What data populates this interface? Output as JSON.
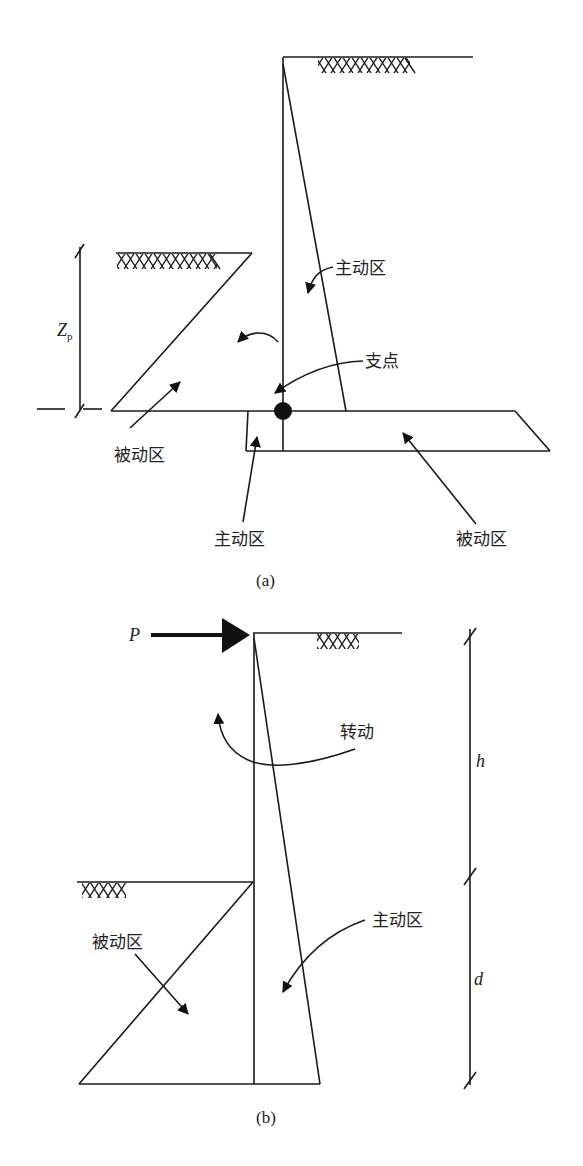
{
  "figure_a": {
    "caption": "(a)",
    "labels": {
      "active_upper": "主动区",
      "pivot": "支点",
      "passive_left": "被动区",
      "active_lower": "主动区",
      "passive_right": "被动区",
      "dimension": "Z",
      "dimension_sub": "p"
    }
  },
  "figure_b": {
    "caption": "(b)",
    "labels": {
      "force": "P",
      "rotation": "转动",
      "active": "主动区",
      "passive": "被动区",
      "height_h": "h",
      "depth_d": "d"
    }
  },
  "colors": {
    "line": "#1a1a1a",
    "background": "#ffffff"
  }
}
